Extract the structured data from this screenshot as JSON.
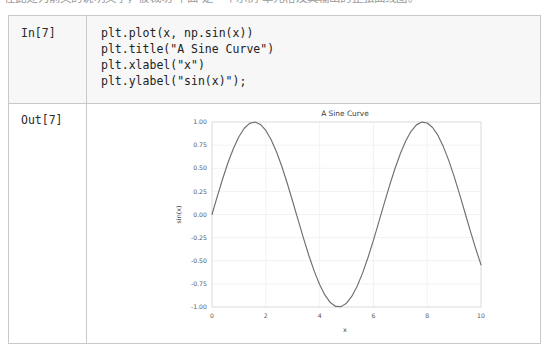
{
  "page": {
    "top_prose_clipped": "在此处为前文的说明文字，被裁切 下面 是一个示例 单元格及其输出的正弦曲线图。"
  },
  "notebook": {
    "input_cell": {
      "prompt_label": "In[7]",
      "code": "plt.plot(x, np.sin(x))\nplt.title(\"A Sine Curve\")\nplt.xlabel(\"x\")\nplt.ylabel(\"sin(x)\");"
    },
    "output_cell": {
      "prompt_label": "Out[7]"
    }
  },
  "chart_data": {
    "type": "line",
    "title": "A Sine Curve",
    "xlabel": "x",
    "ylabel": "sin(x)",
    "xlim": [
      0,
      10
    ],
    "ylim": [
      -1.0,
      1.0
    ],
    "xticks": [
      0,
      2,
      4,
      6,
      8,
      10
    ],
    "xtick_labels": [
      "0",
      "2",
      "4",
      "6",
      "8",
      "10"
    ],
    "yticks": [
      -1.0,
      -0.75,
      -0.5,
      -0.25,
      0.0,
      0.25,
      0.5,
      0.75,
      1.0
    ],
    "ytick_labels": [
      "-1.00",
      "-0.75",
      "-0.50",
      "-0.25",
      "0.00",
      "0.25",
      "0.50",
      "0.75",
      "1.00"
    ],
    "grid": true,
    "legend": null,
    "line_color": "#6f6f6f",
    "series": [
      {
        "name": "sin(x)",
        "x": [
          0.0,
          0.2,
          0.4,
          0.6,
          0.8,
          1.0,
          1.2,
          1.4,
          1.6,
          1.8,
          2.0,
          2.2,
          2.4,
          2.6,
          2.8,
          3.0,
          3.2,
          3.4,
          3.6,
          3.8,
          4.0,
          4.2,
          4.4,
          4.6,
          4.8,
          5.0,
          5.2,
          5.4,
          5.6,
          5.8,
          6.0,
          6.2,
          6.4,
          6.6,
          6.8,
          7.0,
          7.2,
          7.4,
          7.6,
          7.8,
          8.0,
          8.2,
          8.4,
          8.6,
          8.8,
          9.0,
          9.2,
          9.4,
          9.6,
          9.8,
          10.0
        ],
        "y": [
          0.0,
          0.199,
          0.389,
          0.565,
          0.717,
          0.841,
          0.932,
          0.985,
          1.0,
          0.974,
          0.909,
          0.808,
          0.675,
          0.516,
          0.335,
          0.141,
          -0.058,
          -0.256,
          -0.443,
          -0.612,
          -0.757,
          -0.872,
          -0.952,
          -0.994,
          -0.996,
          -0.959,
          -0.883,
          -0.773,
          -0.631,
          -0.465,
          -0.279,
          -0.083,
          0.117,
          0.312,
          0.495,
          0.657,
          0.794,
          0.899,
          0.969,
          0.999,
          0.989,
          0.941,
          0.855,
          0.734,
          0.585,
          0.412,
          0.223,
          0.024,
          -0.174,
          -0.366,
          -0.544
        ]
      }
    ]
  }
}
